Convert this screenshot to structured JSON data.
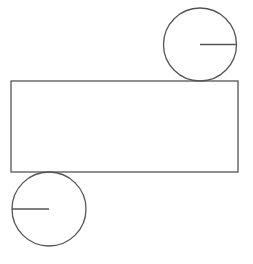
{
  "diagram": {
    "stroke_color": "#555555",
    "background": "#ffffff",
    "rectangle": {
      "x": 11,
      "y": 81,
      "width": 227,
      "height": 91
    },
    "top_circle": {
      "cx": 200,
      "cy": 44.5,
      "r": 36.5,
      "radius_line": {
        "x1": 200,
        "y1": 44.5,
        "x2": 236.5,
        "y2": 44.5
      }
    },
    "bottom_circle": {
      "cx": 49,
      "cy": 209,
      "r": 37,
      "radius_line": {
        "x1": 12,
        "y1": 209,
        "x2": 49,
        "y2": 209
      }
    }
  }
}
